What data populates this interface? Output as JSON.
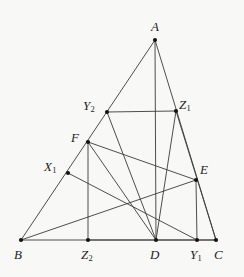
{
  "figure": {
    "type": "geometric-diagram",
    "background_color": "#f8f8f6",
    "line_color": "#3a3a3a",
    "point_color": "#141414",
    "width": 244,
    "height": 277,
    "points": [
      {
        "id": "A",
        "label": "A",
        "sub": "",
        "x": 155,
        "y": 40,
        "label_x": 151,
        "label_y": 20
      },
      {
        "id": "B",
        "label": "B",
        "sub": "",
        "x": 21,
        "y": 240,
        "label_x": 14,
        "label_y": 248
      },
      {
        "id": "C",
        "label": "C",
        "sub": "",
        "x": 216,
        "y": 240,
        "label_x": 214,
        "label_y": 248
      },
      {
        "id": "D",
        "label": "D",
        "sub": "",
        "x": 156,
        "y": 240,
        "label_x": 150,
        "label_y": 248
      },
      {
        "id": "E",
        "label": "E",
        "sub": "",
        "x": 196,
        "y": 180,
        "label_x": 200,
        "label_y": 163
      },
      {
        "id": "F",
        "label": "F",
        "sub": "",
        "x": 88,
        "y": 142,
        "label_x": 71,
        "label_y": 131
      },
      {
        "id": "X1",
        "label": "X",
        "sub": "1",
        "x": 68,
        "y": 173,
        "label_x": 44,
        "label_y": 160
      },
      {
        "id": "Y1",
        "label": "Y",
        "sub": "1",
        "x": 197,
        "y": 240,
        "label_x": 190,
        "label_y": 248
      },
      {
        "id": "Y2",
        "label": "Y",
        "sub": "2",
        "x": 107,
        "y": 112,
        "label_x": 83,
        "label_y": 99
      },
      {
        "id": "Z1",
        "label": "Z",
        "sub": "1",
        "x": 176,
        "y": 111,
        "label_x": 179,
        "label_y": 98
      },
      {
        "id": "Z2",
        "label": "Z",
        "sub": "2",
        "x": 88,
        "y": 240,
        "label_x": 81,
        "label_y": 248
      }
    ],
    "segments": [
      {
        "name": "side-AB",
        "from": "A",
        "to": "B"
      },
      {
        "name": "side-AC",
        "from": "A",
        "to": "C"
      },
      {
        "name": "side-BC",
        "from": "B",
        "to": "C"
      },
      {
        "name": "cevian-AD",
        "from": "A",
        "to": "D"
      },
      {
        "name": "segment-Y2Z1",
        "from": "Y2",
        "to": "Z1"
      },
      {
        "name": "segment-FE",
        "from": "F",
        "to": "E"
      },
      {
        "name": "segment-X1Y1",
        "from": "X1",
        "to": "Y1"
      },
      {
        "name": "segment-BE",
        "from": "B",
        "to": "E"
      },
      {
        "name": "segment-FZ2",
        "from": "F",
        "to": "Z2"
      },
      {
        "name": "segment-EY1",
        "from": "E",
        "to": "Y1"
      },
      {
        "name": "segment-FD",
        "from": "F",
        "to": "D"
      },
      {
        "name": "segment-Y2D",
        "from": "Y2",
        "to": "D"
      },
      {
        "name": "segment-Z1C",
        "from": "Z1",
        "to": "C"
      },
      {
        "name": "segment-Z2C",
        "from": "Z2",
        "to": "C"
      },
      {
        "name": "segment-DZ1",
        "from": "D",
        "to": "Z1"
      }
    ]
  }
}
